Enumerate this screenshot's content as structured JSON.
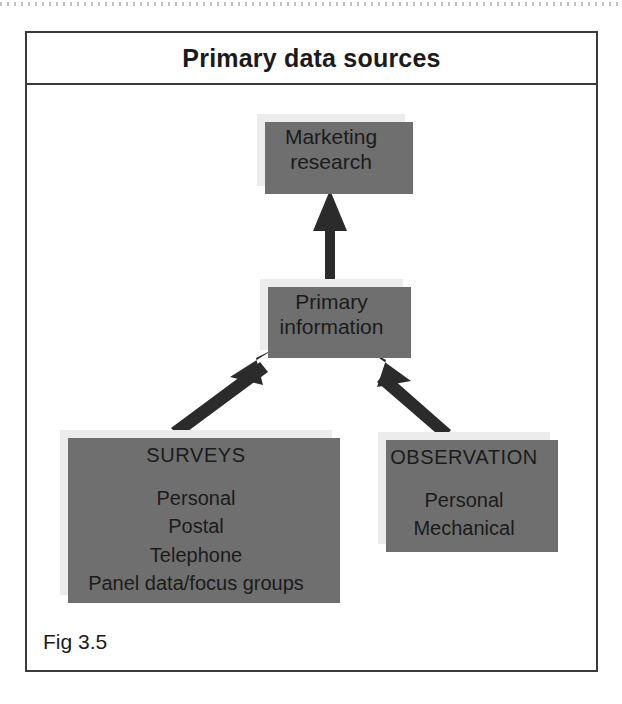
{
  "figure": {
    "title": "Primary data sources",
    "caption": "Fig 3.5"
  },
  "nodes": {
    "marketing_research": {
      "line1": "Marketing",
      "line2": "research"
    },
    "primary_information": {
      "line1": "Primary",
      "line2": "information"
    },
    "surveys": {
      "heading": "SURVEYS",
      "items": [
        "Personal",
        "Postal",
        "Telephone",
        "Panel data/focus groups"
      ]
    },
    "observation": {
      "heading": "OBSERVATION",
      "items": [
        "Personal",
        "Mechanical"
      ]
    }
  },
  "arrows": [
    {
      "name": "surveys-to-primary-information",
      "from": "SURVEYS",
      "to": "Primary information",
      "direction": "up-right"
    },
    {
      "name": "observation-to-primary-information",
      "from": "OBSERVATION",
      "to": "Primary information",
      "direction": "up-left"
    },
    {
      "name": "primary-information-to-marketing-research",
      "from": "Primary information",
      "to": "Marketing research",
      "direction": "up"
    }
  ],
  "colors": {
    "box_fill": "#ececed",
    "box_shadow": "#6f6f6f",
    "frame_line": "#3a3a3a",
    "arrow": "#2b2b2b",
    "text": "#1b1b1b",
    "page_background": "#ffffff"
  }
}
